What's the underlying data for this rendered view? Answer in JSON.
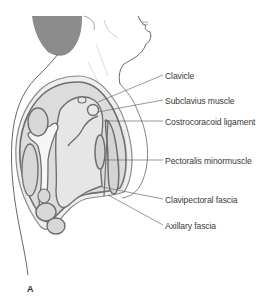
{
  "figure": {
    "panel_letter": "A",
    "colors": {
      "hair": "#8a8a8a",
      "outline": "#7a7a7a",
      "structure_fill": "#d6d6d6",
      "structure_stroke": "#6e6e6e",
      "label_text": "#3a3a3a",
      "leader_line": "#555555"
    }
  },
  "labels": [
    {
      "id": "clavicle",
      "text": "Clavicle"
    },
    {
      "id": "subclavius",
      "text": "Subclavius muscle"
    },
    {
      "id": "costrocoracoid",
      "text": "Costrocoracoid ligament"
    },
    {
      "id": "pectoralis-minor",
      "text": "Pectoralis minormuscle"
    },
    {
      "id": "clavipectoral",
      "text": "Clavipectoral fascia"
    },
    {
      "id": "axillary",
      "text": "Axillary fascia"
    }
  ]
}
